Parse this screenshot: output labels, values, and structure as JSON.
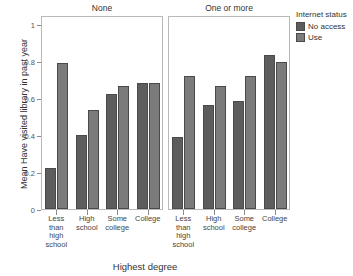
{
  "chart_data": {
    "type": "bar",
    "title": "",
    "xlabel": "Highest degree",
    "ylabel": "Mean Have visited library in past year",
    "ylim": [
      0,
      1.05
    ],
    "yticks": [
      0,
      0.2,
      0.4,
      0.6,
      0.8,
      1
    ],
    "ytick_labels": [
      "0",
      "0.2",
      "0.4",
      "0.6",
      "0.8",
      "1"
    ],
    "grid": false,
    "legend_position": "right",
    "legend_title": "Internet status",
    "categories": [
      "Less than high school",
      "High school",
      "Some college",
      "College"
    ],
    "category_labels": [
      [
        "Less",
        "than",
        "high",
        "school"
      ],
      [
        "High",
        "school"
      ],
      [
        "Some",
        "college"
      ],
      [
        "College"
      ]
    ],
    "facets": [
      {
        "label": "None",
        "series": [
          {
            "name": "No access",
            "color": "#5d5d5d",
            "values": [
              0.22,
              0.4,
              0.625,
              0.68
            ]
          },
          {
            "name": "Use",
            "color": "#7b7b7b",
            "values": [
              0.79,
              0.535,
              0.665,
              0.68
            ]
          }
        ]
      },
      {
        "label": "One or more",
        "series": [
          {
            "name": "No access",
            "color": "#5d5d5d",
            "values": [
              0.39,
              0.565,
              0.585,
              0.835
            ]
          },
          {
            "name": "Use",
            "color": "#7b7b7b",
            "values": [
              0.72,
              0.665,
              0.72,
              0.795
            ]
          }
        ]
      }
    ]
  },
  "legend": {
    "title": "Internet status",
    "items": [
      {
        "label": "No access",
        "color": "#5d5d5d"
      },
      {
        "label": "Use",
        "color": "#7b7b7b"
      }
    ]
  },
  "axes": {
    "y_title": "Mean Have visited library in past year",
    "x_title": "Highest degree"
  }
}
